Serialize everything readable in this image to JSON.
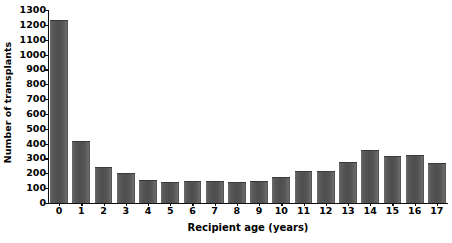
{
  "chart_data": {
    "type": "bar",
    "title": "",
    "xlabel": "Recipient age (years)",
    "ylabel": "Number of transplants",
    "categories": [
      "0",
      "1",
      "2",
      "3",
      "4",
      "5",
      "6",
      "7",
      "8",
      "9",
      "10",
      "11",
      "12",
      "13",
      "14",
      "15",
      "16",
      "17"
    ],
    "values": [
      1230,
      420,
      240,
      200,
      155,
      140,
      145,
      145,
      140,
      150,
      175,
      215,
      215,
      275,
      360,
      320,
      325,
      270
    ],
    "ylim": [
      0,
      1300
    ],
    "ytick_step": 100,
    "yticks": [
      0,
      100,
      200,
      300,
      400,
      500,
      600,
      700,
      800,
      900,
      1000,
      1100,
      1200,
      1300
    ],
    "ytick_labels": [
      "0",
      "100",
      "200",
      "300",
      "400",
      "500",
      "600",
      "700",
      "800",
      "900",
      "1000",
      "1100",
      "1200",
      "1300"
    ],
    "grid": false,
    "legend": false,
    "legend_position": "none",
    "bar_color": "#555555",
    "axis_color": "#111111",
    "background_color": "#ffffff"
  }
}
